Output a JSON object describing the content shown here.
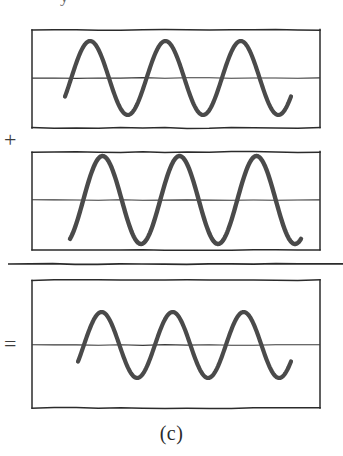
{
  "figure": {
    "caption": "(c)",
    "top_text_fragment": "y",
    "background_color": "#ffffff",
    "ink_color": "#4a4a4a",
    "frame_color": "#2b2b2b",
    "axis_color": "#3a3a3a",
    "operators": {
      "plus": "+",
      "equals": "="
    },
    "divider": {
      "label": "sum-rule-line",
      "x1": 8,
      "x2": 343,
      "y": 264
    }
  },
  "chart_data": {
    "type": "line",
    "title": "(c)",
    "subtitle": "Superposition of two in-phase sinusoids",
    "xlabel": "",
    "ylabel": "",
    "grid": false,
    "legend": "none",
    "xlim": [
      0,
      1
    ],
    "ylim": [
      -1.2,
      1.2
    ],
    "panels": [
      {
        "name": "wave-top",
        "operator_before": "",
        "frame": {
          "x": 32,
          "y": 30,
          "width": 288,
          "height": 98
        },
        "axis_y": 78,
        "waveform": {
          "kind": "sine",
          "cycles": 3,
          "amplitude": 37,
          "phase_deg": -30,
          "x_start": 65,
          "x_end": 291,
          "stroke_width": 4.2
        }
      },
      {
        "name": "wave-middle",
        "operator_before": "+",
        "frame": {
          "x": 32,
          "y": 152,
          "width": 288,
          "height": 98
        },
        "axis_y": 200,
        "waveform": {
          "kind": "sine",
          "cycles": 3,
          "amplitude": 44,
          "phase_deg": -62,
          "x_start": 70,
          "x_end": 301,
          "stroke_width": 4.4
        }
      },
      {
        "name": "wave-sum",
        "operator_before": "=",
        "frame": {
          "x": 32,
          "y": 280,
          "width": 288,
          "height": 128
        },
        "axis_y": 345,
        "waveform": {
          "kind": "sine",
          "cycles": 3,
          "amplitude": 33,
          "phase_deg": -30,
          "x_start": 78,
          "x_end": 291,
          "stroke_width": 4.2
        }
      }
    ]
  }
}
